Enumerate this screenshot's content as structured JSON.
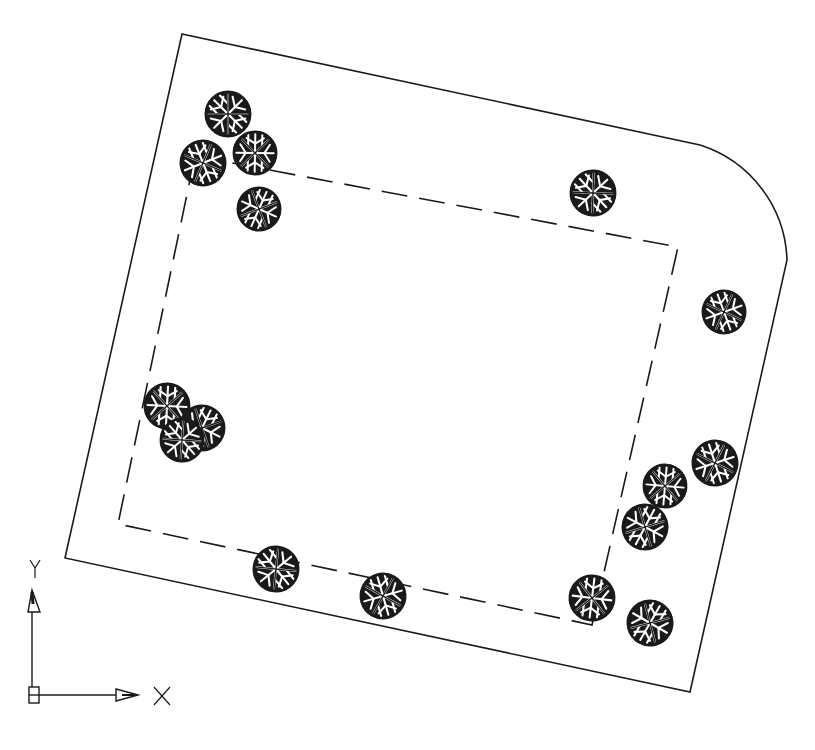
{
  "drawing": {
    "type": "site-plan",
    "line_color": "#1a1a1a",
    "tree_fill": "#1a1a1a",
    "outer_boundary": {
      "points": [
        [
          182,
          34
        ],
        [
          700,
          145
        ],
        [
          787,
          260
        ],
        [
          690,
          692
        ],
        [
          65,
          558
        ]
      ],
      "arc": {
        "from": [
          700,
          145
        ],
        "to": [
          787,
          260
        ],
        "radius": 120
      }
    },
    "inner_boundary_dashed": {
      "points": [
        [
          195,
          156
        ],
        [
          678,
          247
        ],
        [
          592,
          625
        ],
        [
          118,
          524
        ]
      ]
    },
    "trees": [
      {
        "x": 228,
        "y": 114,
        "r": 23
      },
      {
        "x": 203,
        "y": 163,
        "r": 23
      },
      {
        "x": 255,
        "y": 153,
        "r": 22
      },
      {
        "x": 259,
        "y": 209,
        "r": 22
      },
      {
        "x": 593,
        "y": 193,
        "r": 23
      },
      {
        "x": 724,
        "y": 312,
        "r": 22
      },
      {
        "x": 167,
        "y": 406,
        "r": 23
      },
      {
        "x": 202,
        "y": 428,
        "r": 23
      },
      {
        "x": 182,
        "y": 440,
        "r": 22
      },
      {
        "x": 715,
        "y": 463,
        "r": 23
      },
      {
        "x": 665,
        "y": 486,
        "r": 22
      },
      {
        "x": 645,
        "y": 527,
        "r": 23
      },
      {
        "x": 276,
        "y": 569,
        "r": 23
      },
      {
        "x": 383,
        "y": 596,
        "r": 23
      },
      {
        "x": 592,
        "y": 598,
        "r": 23
      },
      {
        "x": 650,
        "y": 623,
        "r": 23
      }
    ]
  },
  "ucs_icon": {
    "x_label": "X",
    "y_label": "Y"
  }
}
